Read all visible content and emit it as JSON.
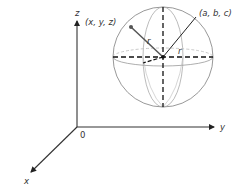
{
  "diagram": {
    "type": "3d-coordinate-sphere",
    "axes": {
      "z_label": "z",
      "y_label": "y",
      "x_label": "x",
      "origin_label": "0"
    },
    "points": {
      "surface_point_label": "(x, y, z)",
      "center_label": "(a, b, c)"
    },
    "radius_labels": [
      "r",
      "r"
    ],
    "colors": {
      "axis": "#333333",
      "sphere": "#888888",
      "dashed": "#111111",
      "radius_line": "#555555"
    }
  }
}
